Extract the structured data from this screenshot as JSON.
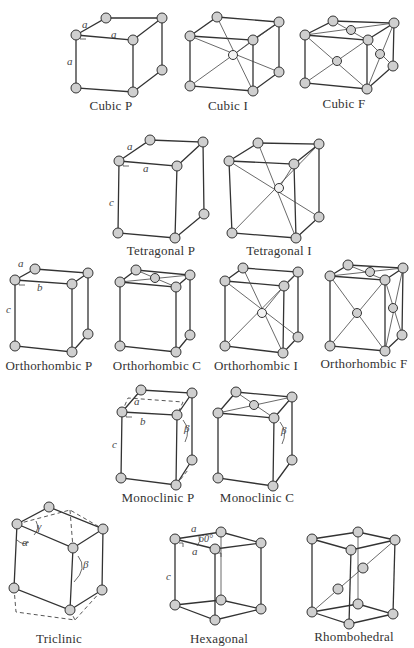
{
  "figure": {
    "lattices": [
      {
        "name": "Cubic P",
        "params": [
          "a",
          "a",
          "a"
        ]
      },
      {
        "name": "Cubic I"
      },
      {
        "name": "Cubic F"
      },
      {
        "name": "Tetragonal P",
        "params": [
          "a",
          "a",
          "c"
        ]
      },
      {
        "name": "Tetragonal I"
      },
      {
        "name": "Orthorhombic P",
        "params": [
          "a",
          "b",
          "c"
        ]
      },
      {
        "name": "Orthorhombic C"
      },
      {
        "name": "Orthorhombic I"
      },
      {
        "name": "Orthorhombic F"
      },
      {
        "name": "Monoclinic P",
        "params": [
          "a",
          "b",
          "c",
          "β"
        ]
      },
      {
        "name": "Monoclinic C",
        "params": [
          "β"
        ]
      },
      {
        "name": "Triclinic",
        "params": [
          "γ",
          "α",
          "β"
        ]
      },
      {
        "name": "Hexagonal",
        "params": [
          "a",
          "60°",
          "a",
          "c"
        ]
      },
      {
        "name": "Rhombohedral"
      }
    ]
  }
}
